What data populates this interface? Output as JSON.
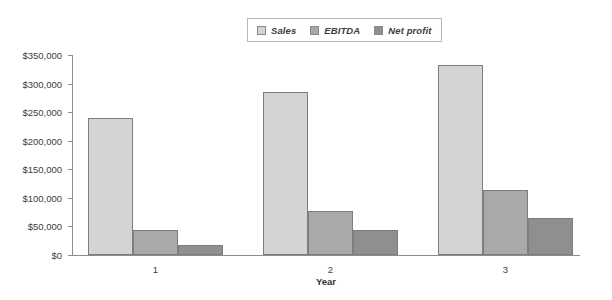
{
  "legend": {
    "position": "top-center",
    "items": [
      {
        "label": "Sales",
        "color": "#d4d4d4"
      },
      {
        "label": "EBITDA",
        "color": "#a9a9a9"
      },
      {
        "label": "Net profit",
        "color": "#8f8f8f"
      }
    ]
  },
  "axes": {
    "x_title": "Year",
    "x_tick_labels": [
      "1",
      "2",
      "3"
    ],
    "y_tick_labels": [
      "$0",
      "$50,000",
      "$100,000",
      "$150,000",
      "$200,000",
      "$250,000",
      "$300,000",
      "$350,000"
    ]
  },
  "chart_data": {
    "type": "bar",
    "title": "",
    "subtitle": "",
    "xlabel": "Year",
    "ylabel": "",
    "categories": [
      "1",
      "2",
      "3"
    ],
    "series": [
      {
        "name": "Sales",
        "color": "#d4d4d4",
        "values": [
          240000,
          285000,
          332000
        ]
      },
      {
        "name": "EBITDA",
        "color": "#a9a9a9",
        "values": [
          44000,
          77000,
          114000
        ]
      },
      {
        "name": "Net profit",
        "color": "#8f8f8f",
        "values": [
          17000,
          44000,
          65000
        ]
      }
    ],
    "ylim": [
      0,
      350000
    ],
    "ytick_step": 50000,
    "yticks": [
      0,
      50000,
      100000,
      150000,
      200000,
      250000,
      300000,
      350000
    ],
    "ytick_labels": [
      "$0",
      "$50,000",
      "$100,000",
      "$150,000",
      "$200,000",
      "$250,000",
      "$300,000",
      "$350,000"
    ],
    "grid": false,
    "legend_position": "top-center",
    "bar_mode": "grouped-adjacent"
  }
}
